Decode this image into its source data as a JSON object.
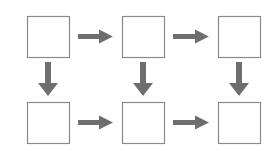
{
  "diagram": {
    "title": "",
    "grid": {
      "rows": 2,
      "cols": 3
    },
    "colors": {
      "box_stroke": "#8a8a8a",
      "box_fill": "#ffffff",
      "arrow": "#6e6e6e",
      "background": "#ffffff"
    },
    "nodes": [
      {
        "id": "r1c1",
        "label": "",
        "x": 27,
        "y": 16,
        "w": 42,
        "h": 41
      },
      {
        "id": "r1c2",
        "label": "",
        "x": 122,
        "y": 16,
        "w": 42,
        "h": 41
      },
      {
        "id": "r1c3",
        "label": "",
        "x": 218,
        "y": 16,
        "w": 42,
        "h": 41
      },
      {
        "id": "r2c1",
        "label": "",
        "x": 27,
        "y": 102,
        "w": 42,
        "h": 41
      },
      {
        "id": "r2c2",
        "label": "",
        "x": 122,
        "y": 102,
        "w": 42,
        "h": 41
      },
      {
        "id": "r2c3",
        "label": "",
        "x": 218,
        "y": 102,
        "w": 42,
        "h": 41
      }
    ],
    "edges": [
      {
        "from": "r1c1",
        "to": "r1c2",
        "direction": "right"
      },
      {
        "from": "r1c2",
        "to": "r1c3",
        "direction": "right"
      },
      {
        "from": "r1c1",
        "to": "r2c1",
        "direction": "down"
      },
      {
        "from": "r1c2",
        "to": "r2c2",
        "direction": "down"
      },
      {
        "from": "r1c3",
        "to": "r2c3",
        "direction": "down"
      },
      {
        "from": "r2c1",
        "to": "r2c2",
        "direction": "right"
      },
      {
        "from": "r2c2",
        "to": "r2c3",
        "direction": "right"
      }
    ]
  }
}
